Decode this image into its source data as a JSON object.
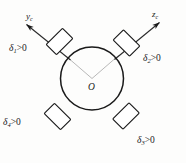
{
  "figure": {
    "background_color": "#fdfdfc",
    "line_color": "#1a1a1a",
    "thin_line_color": "#8a8a8a",
    "origin_label": "O",
    "axes": [
      {
        "id": "y-axis",
        "label_main": "y",
        "label_sub": "c",
        "direction": "up-left",
        "from": [
          92,
          78.5
        ],
        "to": [
          25.5,
          23.5
        ],
        "arrowhead": true
      },
      {
        "id": "z-axis",
        "label_main": "z",
        "label_sub": "c",
        "direction": "up-right",
        "from": [
          92,
          78.5
        ],
        "to": [
          160.5,
          21.5
        ],
        "arrowhead": true
      }
    ],
    "gimbals": [
      {
        "id": "gimbal-1",
        "label_main": "δ",
        "label_sub": "1",
        "label_op": ">0",
        "quadrant": "top-left",
        "center": [
          59.5,
          41.5
        ],
        "width": 23,
        "height": 14.5,
        "rotation": -45
      },
      {
        "id": "gimbal-2",
        "label_main": "δ",
        "label_sub": "2",
        "label_op": ">0",
        "quadrant": "top-right",
        "center": [
          126.5,
          43.0
        ],
        "width": 23,
        "height": 14.5,
        "rotation": 45
      },
      {
        "id": "gimbal-3",
        "label_main": "δ",
        "label_sub": "3",
        "label_op": ">0",
        "quadrant": "bottom-right",
        "center": [
          126.0,
          116.0
        ],
        "width": 23,
        "height": 14.5,
        "rotation": -45
      },
      {
        "id": "gimbal-4",
        "label_main": "δ",
        "label_sub": "4",
        "label_op": ">0",
        "quadrant": "bottom-left",
        "center": [
          57.5,
          116.5
        ],
        "width": 23,
        "height": 14.5,
        "rotation": 45
      }
    ],
    "body_circle": {
      "id": "spacecraft-body",
      "center": [
        92,
        78.5
      ],
      "radius": 31.5
    }
  }
}
